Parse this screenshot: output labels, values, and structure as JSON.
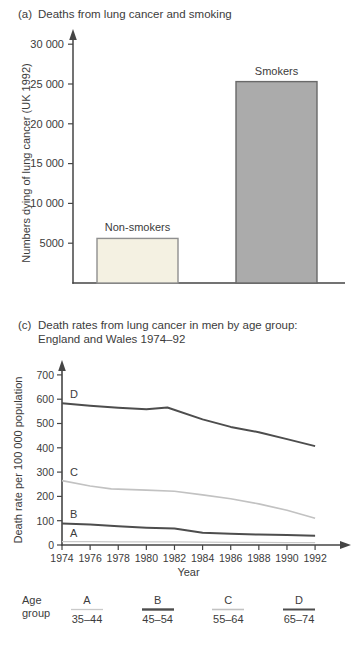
{
  "figure": {
    "panel_a": {
      "label": "(a)",
      "title": "Deaths from lung cancer and smoking"
    },
    "panel_c": {
      "label": "(c)",
      "title_line1": "Death rates from lung cancer in men by age group:",
      "title_line2": "England and Wales 1974–92"
    }
  },
  "chart_data": [
    {
      "type": "bar",
      "panel": "a",
      "title": "Deaths from lung cancer and smoking",
      "categories": [
        "Non-smokers",
        "Smokers"
      ],
      "values": [
        5600,
        25300
      ],
      "ylabel": "Numbers dying of lung cancer (UK 1992)",
      "xlabel": "",
      "ylim": [
        0,
        31000
      ],
      "yticks": [
        5000,
        10000,
        15000,
        20000,
        25000,
        30000
      ],
      "ytick_labels": [
        "5000",
        "10 000",
        "15 000",
        "20 000",
        "25 000",
        "30 000"
      ],
      "grid": false,
      "bar_fills": [
        "#f4f1e2",
        "#ababab"
      ],
      "bar_strokes": [
        "#8f8f8f",
        "#696969"
      ]
    },
    {
      "type": "line",
      "panel": "c",
      "title": "Death rates from lung cancer in men by age group: England and Wales 1974–92",
      "xlabel": "Year",
      "ylabel": "Death rate per 100 000 population",
      "xlim": [
        1974,
        1992
      ],
      "ylim": [
        0,
        760
      ],
      "xticks": [
        1974,
        1976,
        1978,
        1980,
        1982,
        1984,
        1986,
        1988,
        1990,
        1992
      ],
      "yticks": [
        0,
        100,
        200,
        300,
        400,
        500,
        600,
        700
      ],
      "grid": false,
      "legend_position": "bottom",
      "series": [
        {
          "name": "A",
          "age_group": "35–44",
          "color": "#c9c9c9",
          "stroke_width": 1.3,
          "x": [
            1974,
            1976,
            1978,
            1980,
            1982,
            1984,
            1986,
            1988,
            1990,
            1992
          ],
          "values": [
            14,
            14,
            13,
            13,
            13,
            12,
            11,
            11,
            10,
            10
          ]
        },
        {
          "name": "B",
          "age_group": "45–54",
          "color": "#4d4d4d",
          "stroke_width": 2,
          "x": [
            1974,
            1976,
            1978,
            1980,
            1982,
            1984,
            1986,
            1988,
            1990,
            1992
          ],
          "values": [
            89,
            84,
            77,
            71,
            68,
            50,
            46,
            43,
            41,
            38
          ]
        },
        {
          "name": "C",
          "age_group": "55–64",
          "color": "#c2c2c2",
          "stroke_width": 1.6,
          "x": [
            1974,
            1976,
            1977.5,
            1980,
            1982,
            1984,
            1986,
            1988,
            1990,
            1992
          ],
          "values": [
            265,
            243,
            231,
            226,
            221,
            206,
            190,
            169,
            143,
            110
          ]
        },
        {
          "name": "D",
          "age_group": "65–74",
          "color": "#4d4d4d",
          "stroke_width": 2,
          "x": [
            1974,
            1976,
            1978,
            1980,
            1981.5,
            1984,
            1986,
            1988,
            1990,
            1992
          ],
          "values": [
            583,
            573,
            565,
            559,
            566,
            517,
            486,
            464,
            436,
            407
          ]
        }
      ]
    }
  ],
  "legend": {
    "label_line1": "Age",
    "label_line2": "group",
    "entries": [
      {
        "letter": "A",
        "range": "35–44",
        "color": "#c9c9c9",
        "stroke_width": 1.3
      },
      {
        "letter": "B",
        "range": "45–54",
        "color": "#4d4d4d",
        "stroke_width": 2.4
      },
      {
        "letter": "C",
        "range": "55–64",
        "color": "#c2c2c2",
        "stroke_width": 1.6
      },
      {
        "letter": "D",
        "range": "65–74",
        "color": "#4d4d4d",
        "stroke_width": 2
      }
    ]
  },
  "colors": {
    "background": "#ffffff",
    "text": "#3b3b3b",
    "axis": "#454545"
  }
}
